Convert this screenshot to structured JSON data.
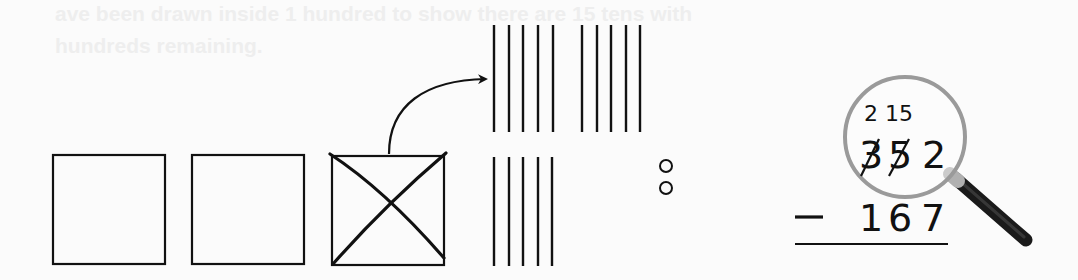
{
  "ghost_text": {
    "line1": "ave been drawn inside 1 hundred to show there are 15 tens with",
    "line2": "hundreds remaining."
  },
  "hundreds": {
    "count": 3,
    "crossed_index": 2
  },
  "tens": {
    "top_group_count": 10,
    "bottom_group_count": 5
  },
  "ones": {
    "count": 2
  },
  "problem": {
    "regroup_top": [
      "2",
      "15"
    ],
    "minuend_digits": [
      "3",
      "5",
      "2"
    ],
    "crossed_digits": [
      0,
      1
    ],
    "operator": "−",
    "subtrahend_digits": [
      "1",
      "6",
      "7"
    ]
  },
  "colors": {
    "ink": "#111111",
    "lens_ring": "#9a9a9a",
    "handle": "#1a1a1a",
    "background": "#fbfbfb"
  }
}
